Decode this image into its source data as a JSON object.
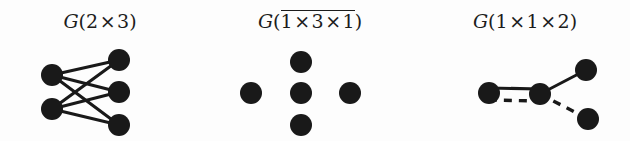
{
  "figure": {
    "background_color": "#fdfdfd",
    "ink_color": "#191919",
    "width": 630,
    "height": 141
  },
  "panels": [
    {
      "id": "panel-0",
      "title": {
        "full_text": "G(2 × 3)",
        "function_name": "G",
        "open_paren": "(",
        "close_paren": ")",
        "overlined": false,
        "factors": [
          "2",
          "3"
        ],
        "separator": "×"
      },
      "graph": {
        "name": "complete-bipartite-2-3",
        "node_radius": 11,
        "nodes": [
          {
            "id": "L1",
            "x": 52,
            "y": 75,
            "label": ""
          },
          {
            "id": "L2",
            "x": 52,
            "y": 109,
            "label": ""
          },
          {
            "id": "R1",
            "x": 119,
            "y": 60,
            "label": ""
          },
          {
            "id": "R2",
            "x": 119,
            "y": 92,
            "label": ""
          },
          {
            "id": "R3",
            "x": 119,
            "y": 125,
            "label": ""
          }
        ],
        "edges": [
          {
            "from": "L1",
            "to": "R1",
            "style": "solid"
          },
          {
            "from": "L1",
            "to": "R2",
            "style": "solid"
          },
          {
            "from": "L1",
            "to": "R3",
            "style": "solid"
          },
          {
            "from": "L2",
            "to": "R1",
            "style": "solid"
          },
          {
            "from": "L2",
            "to": "R2",
            "style": "solid"
          },
          {
            "from": "L2",
            "to": "R3",
            "style": "solid"
          }
        ]
      }
    },
    {
      "id": "panel-1",
      "title": {
        "full_text": "G(1 × 3 × 1)",
        "function_name": "G",
        "open_paren": "(",
        "close_paren": ")",
        "overlined": true,
        "factors": [
          "1",
          "3",
          "1"
        ],
        "separator": "×"
      },
      "graph": {
        "name": "five-isolated-vertices-plus-shape",
        "node_radius": 11,
        "nodes": [
          {
            "id": "T",
            "x": 301,
            "y": 62,
            "label": ""
          },
          {
            "id": "L",
            "x": 251,
            "y": 93,
            "label": ""
          },
          {
            "id": "C",
            "x": 301,
            "y": 93,
            "label": ""
          },
          {
            "id": "R",
            "x": 350,
            "y": 93,
            "label": ""
          },
          {
            "id": "B",
            "x": 301,
            "y": 125,
            "label": ""
          }
        ],
        "edges": []
      }
    },
    {
      "id": "panel-2",
      "title": {
        "full_text": "G(1 × 1 × 2)",
        "function_name": "G",
        "open_paren": "(",
        "close_paren": ")",
        "overlined": false,
        "factors": [
          "1",
          "1",
          "2"
        ],
        "separator": "×"
      },
      "graph": {
        "name": "four-vertex-mixed-edge-graph",
        "node_radius": 11,
        "nodes": [
          {
            "id": "A",
            "x": 489,
            "y": 93,
            "label": ""
          },
          {
            "id": "B",
            "x": 540,
            "y": 94,
            "label": ""
          },
          {
            "id": "C",
            "x": 586,
            "y": 70,
            "label": ""
          },
          {
            "id": "D",
            "x": 588,
            "y": 119,
            "label": ""
          }
        ],
        "edges": [
          {
            "from": "A",
            "to": "B",
            "style": "solid",
            "offset": -5
          },
          {
            "from": "A",
            "to": "B",
            "style": "dashed",
            "offset": 7
          },
          {
            "from": "B",
            "to": "C",
            "style": "solid",
            "offset": 0
          },
          {
            "from": "B",
            "to": "D",
            "style": "dashed",
            "offset": 0
          }
        ]
      }
    }
  ]
}
